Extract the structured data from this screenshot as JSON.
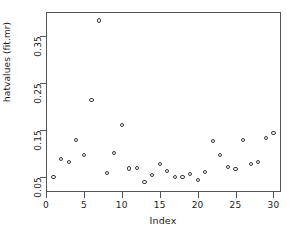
{
  "chart_data": {
    "type": "scatter",
    "title": "",
    "xlabel": "Index",
    "ylabel": "hatvalues (fit.mr)",
    "xlim": [
      0,
      31
    ],
    "ylim": [
      0.018,
      0.4
    ],
    "grid": false,
    "legend": null,
    "xticks": [
      0,
      5,
      10,
      15,
      20,
      25,
      30
    ],
    "xtick_labels": [
      "0",
      "5",
      "10",
      "15",
      "20",
      "25",
      "30"
    ],
    "yticks": [
      0.05,
      0.15,
      0.25,
      0.35
    ],
    "ytick_labels": [
      "0.05",
      "0.15",
      "0.25",
      "0.35"
    ],
    "marker": "open-circle",
    "marker_color": "#3a3a3a",
    "x": [
      1,
      2,
      3,
      4,
      5,
      6,
      7,
      8,
      9,
      10,
      11,
      12,
      13,
      14,
      15,
      16,
      17,
      18,
      19,
      20,
      21,
      22,
      23,
      24,
      25,
      26,
      27,
      28,
      29,
      30
    ],
    "y": [
      0.05,
      0.088,
      0.082,
      0.128,
      0.097,
      0.214,
      0.382,
      0.058,
      0.1,
      0.16,
      0.068,
      0.069,
      0.039,
      0.054,
      0.077,
      0.062,
      0.05,
      0.049,
      0.057,
      0.044,
      0.06,
      0.127,
      0.097,
      0.071,
      0.067,
      0.129,
      0.077,
      0.081,
      0.133,
      0.143
    ],
    "points": [
      {
        "index": 1,
        "value": 0.05
      },
      {
        "index": 2,
        "value": 0.088
      },
      {
        "index": 3,
        "value": 0.082
      },
      {
        "index": 4,
        "value": 0.128
      },
      {
        "index": 5,
        "value": 0.097
      },
      {
        "index": 6,
        "value": 0.214
      },
      {
        "index": 7,
        "value": 0.382
      },
      {
        "index": 8,
        "value": 0.058
      },
      {
        "index": 9,
        "value": 0.1
      },
      {
        "index": 10,
        "value": 0.16
      },
      {
        "index": 11,
        "value": 0.068
      },
      {
        "index": 12,
        "value": 0.069
      },
      {
        "index": 13,
        "value": 0.039
      },
      {
        "index": 14,
        "value": 0.054
      },
      {
        "index": 15,
        "value": 0.077
      },
      {
        "index": 16,
        "value": 0.062
      },
      {
        "index": 17,
        "value": 0.05
      },
      {
        "index": 18,
        "value": 0.049
      },
      {
        "index": 19,
        "value": 0.057
      },
      {
        "index": 20,
        "value": 0.044
      },
      {
        "index": 21,
        "value": 0.06
      },
      {
        "index": 22,
        "value": 0.127
      },
      {
        "index": 23,
        "value": 0.097
      },
      {
        "index": 24,
        "value": 0.071
      },
      {
        "index": 25,
        "value": 0.067
      },
      {
        "index": 26,
        "value": 0.129
      },
      {
        "index": 27,
        "value": 0.077
      },
      {
        "index": 28,
        "value": 0.081
      },
      {
        "index": 29,
        "value": 0.133
      },
      {
        "index": 30,
        "value": 0.143
      }
    ]
  }
}
